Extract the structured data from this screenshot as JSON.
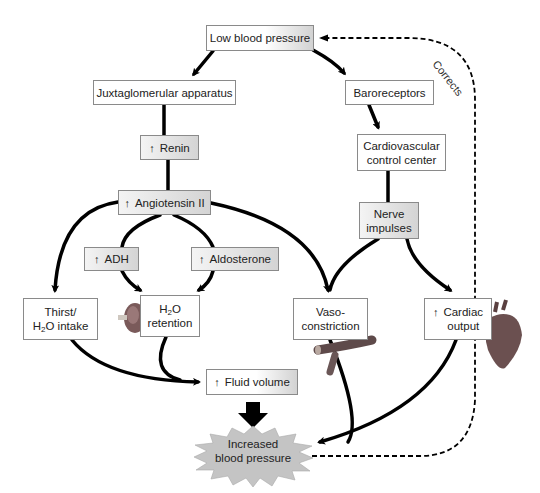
{
  "diagram": {
    "type": "flowchart",
    "topic": "Regulation of blood pressure (renin-angiotensin and baroreceptor pathways)",
    "colors": {
      "line": "#000000",
      "box_border": "#8a8a8a",
      "shaded_box": "#e0e0e0",
      "burst_fill": "#c8c8c8"
    },
    "nodes": {
      "low_bp": {
        "label": "Low blood pressure"
      },
      "jga": {
        "label": "Juxtaglomerular apparatus"
      },
      "baro": {
        "label": "Baroreceptors"
      },
      "renin": {
        "arrow": "↑",
        "label": "Renin"
      },
      "cv_center": {
        "line1": "Cardiovascular",
        "line2": "control center"
      },
      "angiotensin": {
        "arrow": "↑",
        "label": "Angiotensin II"
      },
      "nerve": {
        "line1": "Nerve",
        "line2": "impulses"
      },
      "adh": {
        "arrow": "↑",
        "label": "ADH"
      },
      "aldosterone": {
        "arrow": "↑",
        "label": "Aldosterone"
      },
      "thirst": {
        "line1": "Thirst/",
        "line2_pre": "H",
        "line2_sub": "2",
        "line2_post": "O intake"
      },
      "h2o_retention": {
        "line1_pre": "H",
        "line1_sub": "2",
        "line1_post": "O",
        "line2": "retention"
      },
      "vaso": {
        "line1": "Vaso-",
        "line2": "constriction"
      },
      "cardiac": {
        "arrow": "↑",
        "line1": "Cardiac",
        "line2": "output"
      },
      "fluid": {
        "arrow": "↑",
        "label": "Fluid volume"
      },
      "increased_bp": {
        "line1": "Increased",
        "line2": "blood pressure"
      }
    },
    "feedback_label": "Corrects",
    "edges": [
      [
        "low_bp",
        "jga"
      ],
      [
        "low_bp",
        "baro"
      ],
      [
        "jga",
        "renin"
      ],
      [
        "renin",
        "angiotensin"
      ],
      [
        "baro",
        "cv_center"
      ],
      [
        "cv_center",
        "nerve"
      ],
      [
        "angiotensin",
        "thirst"
      ],
      [
        "angiotensin",
        "adh"
      ],
      [
        "angiotensin",
        "aldosterone"
      ],
      [
        "angiotensin",
        "vaso"
      ],
      [
        "adh",
        "h2o_retention"
      ],
      [
        "aldosterone",
        "h2o_retention"
      ],
      [
        "nerve",
        "vaso"
      ],
      [
        "nerve",
        "cardiac"
      ],
      [
        "thirst",
        "fluid"
      ],
      [
        "h2o_retention",
        "fluid"
      ],
      [
        "fluid",
        "increased_bp"
      ],
      [
        "vaso",
        "increased_bp"
      ],
      [
        "cardiac",
        "increased_bp"
      ],
      [
        "increased_bp",
        "low_bp",
        "dashed: Corrects"
      ]
    ],
    "illustrations": [
      "kidney-icon",
      "blood-vessel-icon",
      "heart-icon"
    ]
  }
}
